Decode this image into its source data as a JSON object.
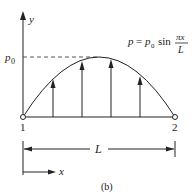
{
  "diagram": {
    "axis_y_label": "y",
    "axis_x_label": "x",
    "peak_label_base": "p",
    "peak_label_sub": "0",
    "formula": {
      "lhs": "p",
      "eq": "=",
      "p0_base": "p",
      "p0_sub": "0",
      "func": "sin",
      "numerator": "πx",
      "denominator": "L"
    },
    "node_labels": [
      "1",
      "2"
    ],
    "dimension_label": "L",
    "caption": "(b)",
    "load_arrows_count": 4,
    "colors": {
      "line": "#222222",
      "dashed": "#555555",
      "background": "#ffffff"
    }
  }
}
